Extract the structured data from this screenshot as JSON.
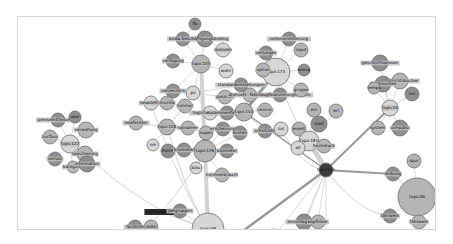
{
  "diagram": {
    "type": "topic-network",
    "colors": {
      "node_light": "#d6d6d6",
      "node_mid": "#b4b4b4",
      "node_dark": "#8e8e8e",
      "node_hub": "#3c3c3c",
      "edge_light": "#dedede",
      "edge_heavy": "#9a9a9a",
      "label_highlight": "#2a2a2a"
    },
    "nodes": [
      {
        "id": "n1",
        "label": "flo",
        "tone": "dark"
      },
      {
        "id": "n2",
        "label": "bildauflösung",
        "tone": "dark"
      },
      {
        "id": "n3",
        "label": "beschäftigungsbeding",
        "tone": "dark"
      },
      {
        "id": "n4",
        "label": "motoren",
        "tone": "light"
      },
      {
        "id": "n5",
        "label": "verfügung",
        "tone": "dark"
      },
      {
        "id": "n6",
        "label": "topic105",
        "tone": "mid"
      },
      {
        "id": "n7",
        "label": "wahr",
        "tone": "light"
      },
      {
        "id": "n8",
        "label": "verzeichnis",
        "tone": "dark"
      },
      {
        "id": "n9",
        "label": "ps",
        "tone": "light"
      },
      {
        "id": "n10",
        "label": "passiver",
        "tone": "mid"
      },
      {
        "id": "n11",
        "label": "standardeinstellungen",
        "tone": "dark"
      },
      {
        "id": "n12",
        "label": "newsletter",
        "tone": "light"
      },
      {
        "id": "n13",
        "label": "mozilla",
        "tone": "mid"
      },
      {
        "id": "n14",
        "label": "hotmail",
        "tone": "mid"
      },
      {
        "id": "n15",
        "label": "taglicherstellung",
        "tone": "light"
      },
      {
        "id": "n16",
        "label": "zusammenfassung",
        "tone": "dark"
      },
      {
        "id": "n17",
        "label": "lesefenster",
        "tone": "mid"
      },
      {
        "id": "n18",
        "label": "topic128",
        "tone": "mid"
      },
      {
        "id": "n19",
        "label": "hatnamen",
        "tone": "mid"
      },
      {
        "id": "n20",
        "label": "super",
        "tone": "mid"
      },
      {
        "id": "n21",
        "label": "erscheinung",
        "tone": "dark"
      },
      {
        "id": "n22",
        "label": "kosten",
        "tone": "dark"
      },
      {
        "id": "n23",
        "label": "nm",
        "tone": "light"
      },
      {
        "id": "n24",
        "label": "therm",
        "tone": "dark"
      },
      {
        "id": "n25",
        "label": "kilometer",
        "tone": "dark"
      },
      {
        "id": "n26",
        "label": "topic176",
        "tone": "mid"
      },
      {
        "id": "n27",
        "label": "kilometer",
        "tone": "dark"
      },
      {
        "id": "n28",
        "label": "blau",
        "tone": "light"
      },
      {
        "id": "n29",
        "label": "normverbrauch",
        "tone": "mid"
      },
      {
        "id": "n30",
        "label": "topic110",
        "tone": "mid"
      },
      {
        "id": "n31",
        "label": "version",
        "tone": "mid"
      },
      {
        "id": "n32",
        "label": "schnitzeln",
        "tone": "dark"
      },
      {
        "id": "n33",
        "label": "drehzahlverdichtung",
        "tone": "mid"
      },
      {
        "id": "n34",
        "label": "fahrzeugfinanzierungskosten",
        "tone": "dark"
      },
      {
        "id": "n35",
        "label": "seitenorientierung",
        "tone": "dark"
      },
      {
        "id": "n36",
        "label": "topic173",
        "tone": "light"
      },
      {
        "id": "n37",
        "label": "versorgen",
        "tone": "dark"
      },
      {
        "id": "n38",
        "label": "input",
        "tone": "mid"
      },
      {
        "id": "n39",
        "label": "option",
        "tone": "mid"
      },
      {
        "id": "n40",
        "label": "gruppe",
        "tone": "mid"
      },
      {
        "id": "n41",
        "label": "wenig",
        "tone": "dark"
      },
      {
        "id": "n42",
        "label": "sol",
        "tone": "light"
      },
      {
        "id": "n43",
        "label": "event",
        "tone": "mid"
      },
      {
        "id": "n44",
        "label": "malt",
        "tone": "dark"
      },
      {
        "id": "n45",
        "label": "topic181",
        "tone": "light"
      },
      {
        "id": "n46",
        "label": "ein",
        "tone": "mid"
      },
      {
        "id": "n47",
        "label": "all",
        "tone": "light"
      },
      {
        "id": "n48",
        "label": "erl",
        "tone": "mid"
      },
      {
        "id": "n49",
        "label": "hochdruck",
        "tone": "mid"
      },
      {
        "id": "n50",
        "label": "topic145",
        "tone": "hub"
      },
      {
        "id": "n51",
        "label": "geschichtswissen",
        "tone": "dark"
      },
      {
        "id": "n52",
        "label": "geschichtsbücher",
        "tone": "mid"
      },
      {
        "id": "n53",
        "label": "durchsuchen",
        "tone": "dark"
      },
      {
        "id": "n54",
        "label": "tempo",
        "tone": "mid"
      },
      {
        "id": "n55",
        "label": "topic16",
        "tone": "light"
      },
      {
        "id": "n56",
        "label": "tos",
        "tone": "dark"
      },
      {
        "id": "n57",
        "label": "system",
        "tone": "mid"
      },
      {
        "id": "n58",
        "label": "compdisc",
        "tone": "dark"
      },
      {
        "id": "n59",
        "label": "spur",
        "tone": "mid"
      },
      {
        "id": "n60",
        "label": "lenkung",
        "tone": "dark"
      },
      {
        "id": "n61",
        "label": "topic46",
        "tone": "mid"
      },
      {
        "id": "n62",
        "label": "fahrwerk",
        "tone": "dark"
      },
      {
        "id": "n63",
        "label": "fahrwerk",
        "tone": "mid"
      },
      {
        "id": "n64",
        "label": "pressemitteilungen",
        "tone": "dark"
      },
      {
        "id": "n65",
        "label": "user",
        "tone": "dark"
      },
      {
        "id": "n66",
        "label": "verwaltung",
        "tone": "mid"
      },
      {
        "id": "n67",
        "label": "surfbox",
        "tone": "mid"
      },
      {
        "id": "n68",
        "label": "topic122",
        "tone": "light"
      },
      {
        "id": "n69",
        "label": "speicherung",
        "tone": "mid"
      },
      {
        "id": "n70",
        "label": "verlust",
        "tone": "dark"
      },
      {
        "id": "n71",
        "label": "kategorie",
        "tone": "mid"
      },
      {
        "id": "n72",
        "label": "information",
        "tone": "dark"
      },
      {
        "id": "n73",
        "label": "verbindungen",
        "tone": "highlight"
      },
      {
        "id": "n74",
        "label": "zielgruppen",
        "tone": "dark"
      },
      {
        "id": "n75",
        "label": "topic48",
        "tone": "light"
      },
      {
        "id": "n76",
        "label": "kofferraum",
        "tone": "dark"
      },
      {
        "id": "n77",
        "label": "fachliste",
        "tone": "dark"
      },
      {
        "id": "n78",
        "label": "seite",
        "tone": "mid"
      },
      {
        "id": "n79",
        "label": "hardware",
        "tone": "dark"
      },
      {
        "id": "n80",
        "label": "heck",
        "tone": "mid"
      },
      {
        "id": "n81",
        "label": "heckklappenfunktion",
        "tone": "mid"
      },
      {
        "id": "n82",
        "label": "spurensuche",
        "tone": "dark"
      },
      {
        "id": "n83",
        "label": "einschlagwinkel",
        "tone": "dark"
      },
      {
        "id": "n84",
        "label": "reihe",
        "tone": "light"
      },
      {
        "id": "n85",
        "label": "topic155",
        "tone": "mid"
      },
      {
        "id": "n86",
        "label": "erfahrung",
        "tone": "dark"
      },
      {
        "id": "n87",
        "label": "kopfhörer",
        "tone": "mid"
      }
    ]
  }
}
